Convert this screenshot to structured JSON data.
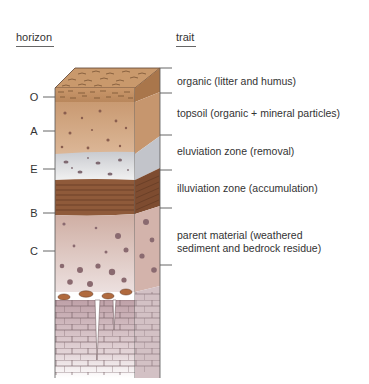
{
  "headers": {
    "horizon": "horizon",
    "trait": "trait"
  },
  "horizons": [
    {
      "letter": "O",
      "trait": "organic (litter and humus)",
      "color": "#b98a5e"
    },
    {
      "letter": "A",
      "trait": "topsoil (organic + mineral particles)",
      "color": "#d2a883"
    },
    {
      "letter": "E",
      "trait": "eluviation zone (removal)",
      "color": "#dcdde0"
    },
    {
      "letter": "B",
      "trait": "illuviation zone (accumulation)",
      "color": "#8f5a3a"
    },
    {
      "letter": "C",
      "trait_line1": "parent material (weathered",
      "trait_line2": "sediment and bedrock residue)",
      "color": "#d9bcb4"
    }
  ],
  "bedrock": {
    "color": "#c9acb2"
  }
}
